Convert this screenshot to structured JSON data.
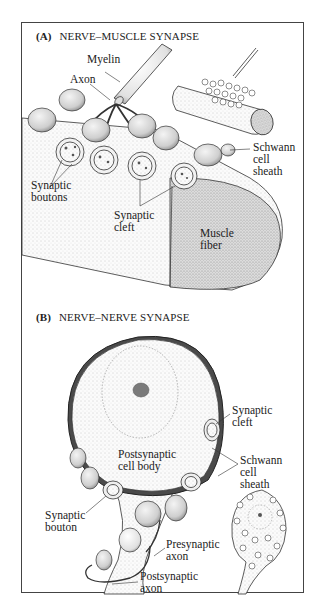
{
  "figure": {
    "panels": [
      {
        "letter": "(A)",
        "title": "NERVE–MUSCLE SYNAPSE",
        "labels": {
          "myelin": "Myelin",
          "axon": "Axon",
          "schwann_1": "Schwann",
          "schwann_2": "cell",
          "schwann_3": "sheath",
          "boutons_1": "Synaptic",
          "boutons_2": "boutons",
          "cleft_1": "Synaptic",
          "cleft_2": "cleft",
          "muscle_1": "Muscle",
          "muscle_2": "fiber"
        }
      },
      {
        "letter": "(B)",
        "title": "NERVE–NERVE SYNAPSE",
        "labels": {
          "cleft_1": "Synaptic",
          "cleft_2": "cleft",
          "schwann_1": "Schwann",
          "schwann_2": "cell",
          "schwann_3": "sheath",
          "cellbody_1": "Postsynaptic",
          "cellbody_2": "cell body",
          "bouton_1": "Synaptic",
          "bouton_2": "bouton",
          "pre_1": "Presynaptic",
          "pre_2": "axon",
          "post_1": "Postsynaptic",
          "post_2": "axon"
        }
      }
    ],
    "colors": {
      "ink": "#222222",
      "stipple": "#9a9a9a",
      "muscle_end": "#c8c8c8",
      "nucleus": "#7a7a7a",
      "frame": "#444444"
    }
  }
}
